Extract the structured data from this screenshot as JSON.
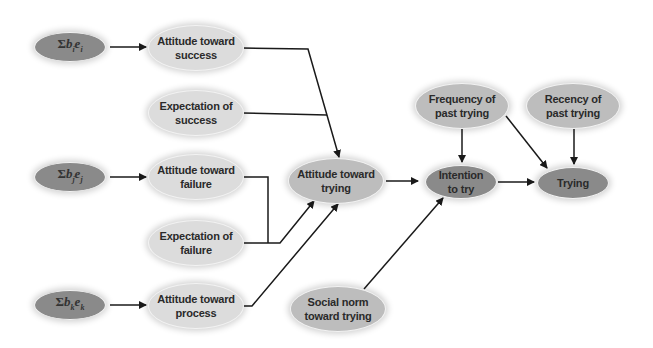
{
  "diagram": {
    "type": "flow",
    "title": "",
    "colors": {
      "light_node": "#dcdcdc",
      "mid_node": "#bdbdbd",
      "dark_node": "#8a8a8a",
      "edge": "#1a1a1a"
    },
    "nodes": {
      "sum_i": {
        "sigma": "Σ",
        "b": "b",
        "i": "i",
        "e": "e",
        "label": "Σbᵢeᵢ"
      },
      "sum_j": {
        "sigma": "Σ",
        "b": "b",
        "j": "j",
        "e": "e",
        "label": "Σbⱼeⱼ"
      },
      "sum_k": {
        "sigma": "Σ",
        "b": "b",
        "k": "k",
        "e": "e",
        "label": "Σbₖeₖ"
      },
      "att_success": {
        "label": "Attitude toward\nsuccess"
      },
      "exp_success": {
        "label": "Expectation of\nsuccess"
      },
      "att_failure": {
        "label": "Attitude toward\nfailure"
      },
      "exp_failure": {
        "label": "Expectation of\nfailure"
      },
      "att_process": {
        "label": "Attitude toward\nprocess"
      },
      "att_trying": {
        "label": "Attitude toward\ntrying"
      },
      "social_norm": {
        "label": "Social norm\ntoward trying"
      },
      "intention": {
        "label": "Intention\nto try"
      },
      "freq_past": {
        "label": "Frequency of\npast trying"
      },
      "recency_past": {
        "label": "Recency of\npast trying"
      },
      "trying": {
        "label": "Trying"
      }
    },
    "edges": [
      {
        "from": "sum_i",
        "to": "att_success"
      },
      {
        "from": "sum_j",
        "to": "att_failure"
      },
      {
        "from": "sum_k",
        "to": "att_process"
      },
      {
        "from": "att_success",
        "to": "att_trying",
        "joined_with": "exp_success"
      },
      {
        "from": "exp_success",
        "to": "att_trying",
        "joined_with": "att_success"
      },
      {
        "from": "att_failure",
        "to": "att_trying",
        "joined_with": "exp_failure"
      },
      {
        "from": "exp_failure",
        "to": "att_trying",
        "joined_with": "att_failure"
      },
      {
        "from": "att_process",
        "to": "att_trying"
      },
      {
        "from": "att_trying",
        "to": "intention"
      },
      {
        "from": "social_norm",
        "to": "intention"
      },
      {
        "from": "freq_past",
        "to": "intention"
      },
      {
        "from": "freq_past",
        "to": "trying"
      },
      {
        "from": "recency_past",
        "to": "trying"
      },
      {
        "from": "intention",
        "to": "trying"
      }
    ]
  }
}
